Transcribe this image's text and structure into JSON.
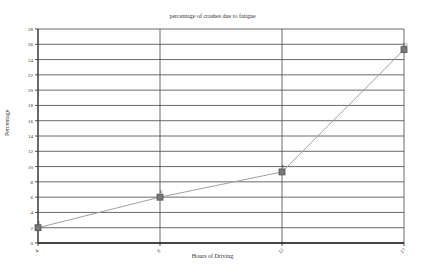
{
  "chart_data": {
    "type": "line",
    "title": "percentage of crashes due to fatigue",
    "xlabel": "Hours of Driving",
    "ylabel": "Percentage",
    "categories": [
      "4",
      "8",
      "12",
      "17"
    ],
    "series": [
      {
        "name": "Percentage",
        "values": [
          2,
          6,
          9.3,
          25.3
        ],
        "labels": [
          "2",
          "6",
          "9",
          "25"
        ]
      }
    ],
    "ylim": [
      0,
      28
    ],
    "yticks": [
      0,
      2,
      4,
      6,
      8,
      10,
      12,
      14,
      16,
      18,
      20,
      22,
      24,
      26,
      28
    ],
    "grid": true,
    "legend": "none",
    "colors": {
      "line": "#a0a0a0",
      "marker": "#555555",
      "grid": "#444444",
      "axis": "#222222"
    }
  }
}
